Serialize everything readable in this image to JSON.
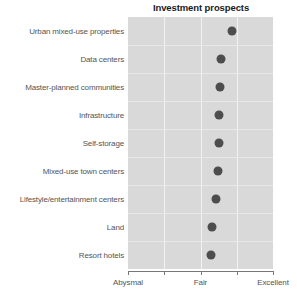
{
  "chart_data": {
    "type": "scatter",
    "title": "Investment prospects",
    "xlabel": "",
    "ylabel": "",
    "grid": true,
    "legend": false,
    "xlim": [
      1,
      5
    ],
    "x_tick_labels": [
      "Abysmal",
      "",
      "Fair",
      "",
      "Excellent"
    ],
    "x_tick_values": [
      1,
      2,
      3,
      4,
      5
    ],
    "x_axis_labeled_ticks": [
      {
        "label": "Abysmal",
        "value": 1
      },
      {
        "label": "Fair",
        "value": 3
      },
      {
        "label": "Excellent",
        "value": 5
      }
    ],
    "categories": [
      "Urban mixed-use properties",
      "Data centers",
      "Master-planned communities",
      "Infrastructure",
      "Self-storage",
      "Mixed-use town centers",
      "Lifestyle/entertainment centers",
      "Land",
      "Resort hotels"
    ],
    "values": [
      3.86,
      3.57,
      3.54,
      3.52,
      3.52,
      3.49,
      3.44,
      3.32,
      3.28
    ],
    "series": [
      {
        "name": "Investment prospects",
        "values": [
          3.86,
          3.57,
          3.54,
          3.52,
          3.52,
          3.49,
          3.44,
          3.32,
          3.28
        ]
      }
    ],
    "marker": "filled-circle",
    "marker_color": "#4d4d4d",
    "panel_background": "#d9d9d9",
    "gridline_color": "#f2f2f2"
  },
  "colors": {
    "dot": "#4d4d4d",
    "panel": "#d9d9d9",
    "vertical_gridline": "#f2f2f2",
    "horizontal_gridline": "#e8e8e8",
    "axis": "#777777",
    "label_text": "#555555",
    "title_text": "#1a1a1a",
    "page_background": "#ffffff"
  }
}
